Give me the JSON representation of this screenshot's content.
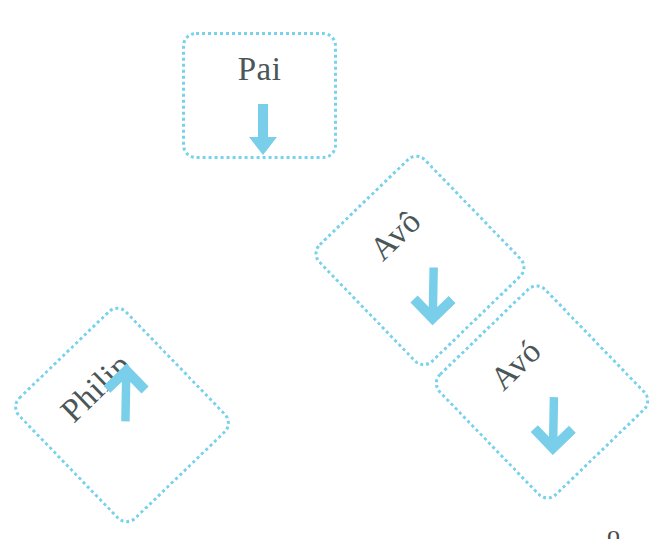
{
  "canvas": {
    "width": 671,
    "height": 542,
    "background_color": "#ffffff"
  },
  "style": {
    "border_color": "#79d2ec",
    "arrow_color": "#79cfe9",
    "text_color": "#4a5658",
    "border_style": "dotted",
    "border_radius_px": 14
  },
  "diagram": {
    "type": "relationship-path",
    "nodes": [
      {
        "id": "pai",
        "label": "Pai",
        "arrow_icon": "arrow-down-icon",
        "arrow_direction": "down",
        "rotation_deg": 0,
        "x": 182,
        "y": 32,
        "w": 155,
        "h": 127
      },
      {
        "id": "avo-circumflex",
        "label": "Avô",
        "arrow_icon": "arrow-down-left-icon",
        "arrow_direction": "down-left",
        "rotation_deg": -44,
        "x": 345,
        "y": 178,
        "w": 150,
        "h": 165
      },
      {
        "id": "avo-acute",
        "label": "Avó",
        "arrow_icon": "arrow-down-left-icon",
        "arrow_direction": "down-left",
        "rotation_deg": -44,
        "x": 467,
        "y": 307,
        "w": 150,
        "h": 170
      },
      {
        "id": "philip",
        "label": "Philip",
        "arrow_icon": "arrow-up-right-icon",
        "arrow_direction": "up-right",
        "rotation_deg": -44,
        "x": 46,
        "y": 330,
        "w": 152,
        "h": 170
      }
    ],
    "corner_artifact": "ô"
  }
}
